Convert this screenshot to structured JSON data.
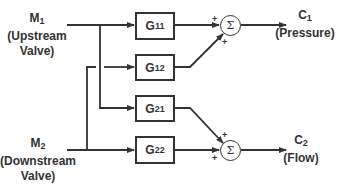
{
  "diagram": {
    "type": "block-diagram",
    "inputs": [
      {
        "symbol": "M",
        "sub": "1",
        "line1": "(Upstream",
        "line2": "Valve)"
      },
      {
        "symbol": "M",
        "sub": "2",
        "line1": "(Downstream",
        "line2": "Valve)"
      }
    ],
    "blocks": [
      {
        "symbol": "G",
        "sub": "11"
      },
      {
        "symbol": "G",
        "sub": "12"
      },
      {
        "symbol": "G",
        "sub": "21"
      },
      {
        "symbol": "G",
        "sub": "22"
      }
    ],
    "summers": [
      {
        "glyph": "Σ",
        "signs": [
          "+",
          "+"
        ]
      },
      {
        "glyph": "Σ",
        "signs": [
          "+",
          "+"
        ]
      }
    ],
    "outputs": [
      {
        "symbol": "C",
        "sub": "1",
        "line1": "(Pressure)"
      },
      {
        "symbol": "C",
        "sub": "2",
        "line1": "(Flow)"
      }
    ],
    "connections": [
      "M1 -> G11",
      "M1 -> G21",
      "M2 -> G12",
      "M2 -> G22",
      "G11 -> Sum1",
      "G12 -> Sum1",
      "G21 -> Sum2",
      "G22 -> Sum2",
      "Sum1 -> C1",
      "Sum2 -> C2"
    ]
  }
}
